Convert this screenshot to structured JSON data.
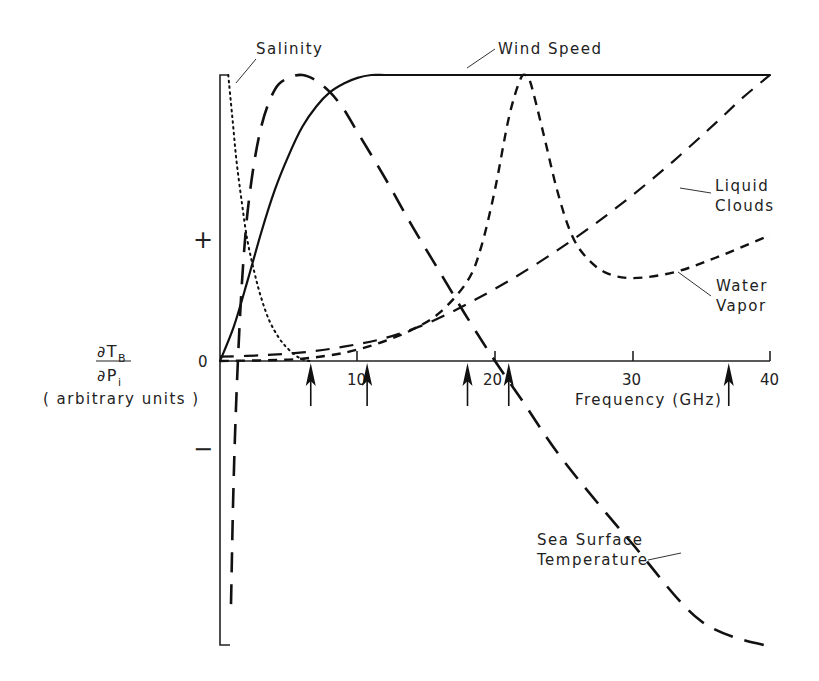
{
  "chart_data": {
    "type": "line",
    "title": "",
    "xlabel": "Frequency (GHz)",
    "ylabel_numerator": "∂T",
    "ylabel_numerator_sub": "B",
    "ylabel_denominator": "∂P",
    "ylabel_denominator_sub": "i",
    "ylabel_units": "( arbitrary units )",
    "xlim": [
      0,
      40
    ],
    "ylim": [
      -1.0,
      1.0
    ],
    "x_ticks": [
      10,
      20,
      30,
      40
    ],
    "x_tick_labels": [
      "10",
      "20",
      "30",
      "40"
    ],
    "y_tick_labels": {
      "plus": "+",
      "zero": "0",
      "minus": "−"
    },
    "grid": false,
    "legend": "inline annotations",
    "marked_frequencies_ghz": [
      6.6,
      10.7,
      18.0,
      21.0,
      37.0
    ],
    "series": [
      {
        "name": "Salinity",
        "style": "dotted",
        "x": [
          0.6,
          0.9,
          1.2,
          1.6,
          2.0,
          2.5,
          3.0,
          3.6,
          4.3,
          5.0,
          5.8,
          6.5
        ],
        "y": [
          1.0,
          0.85,
          0.7,
          0.55,
          0.42,
          0.31,
          0.22,
          0.14,
          0.08,
          0.04,
          0.01,
          0.0
        ]
      },
      {
        "name": "Wind Speed",
        "style": "solid",
        "x": [
          0,
          1,
          2,
          3,
          4,
          5,
          6,
          7,
          8,
          9,
          10,
          11,
          12,
          13,
          15,
          20,
          25,
          30,
          35,
          40
        ],
        "y": [
          0.0,
          0.12,
          0.28,
          0.45,
          0.6,
          0.72,
          0.82,
          0.89,
          0.94,
          0.97,
          0.99,
          1.0,
          1.0,
          1.0,
          1.0,
          1.0,
          1.0,
          1.0,
          1.0,
          1.0
        ]
      },
      {
        "name": "Sea Surface Temperature",
        "style": "long-dash",
        "x": [
          0.8,
          1.0,
          1.3,
          1.7,
          2.2,
          3.0,
          4.0,
          5.0,
          6.0,
          7.0,
          8.0,
          9.0,
          10.0,
          12.0,
          14.0,
          16.0,
          18.0,
          20.0,
          22.0,
          25.0,
          30.0,
          35.0,
          40.0
        ],
        "y": [
          -0.85,
          -0.4,
          0.0,
          0.35,
          0.6,
          0.82,
          0.95,
          0.99,
          1.0,
          0.98,
          0.94,
          0.88,
          0.8,
          0.64,
          0.47,
          0.31,
          0.15,
          0.0,
          -0.14,
          -0.35,
          -0.64,
          -0.91,
          -1.0
        ]
      },
      {
        "name": "Water Vapor",
        "style": "short-dash",
        "x": [
          0,
          5,
          8,
          10,
          12,
          14,
          16,
          18,
          19,
          20,
          21,
          21.8,
          22.2,
          22.6,
          23.5,
          24.5,
          25.5,
          26.5,
          28,
          30,
          33,
          36,
          40
        ],
        "y": [
          0.0,
          0.005,
          0.02,
          0.04,
          0.07,
          0.11,
          0.17,
          0.28,
          0.4,
          0.6,
          0.85,
          0.98,
          1.0,
          0.97,
          0.8,
          0.6,
          0.45,
          0.37,
          0.31,
          0.29,
          0.31,
          0.36,
          0.44
        ]
      },
      {
        "name": "Liquid Clouds",
        "style": "medium-dash",
        "x": [
          0,
          3,
          6,
          9,
          12,
          15,
          18,
          21,
          24,
          27,
          30,
          33,
          36,
          38,
          40
        ],
        "y": [
          0.015,
          0.02,
          0.03,
          0.05,
          0.08,
          0.13,
          0.2,
          0.28,
          0.37,
          0.47,
          0.58,
          0.7,
          0.83,
          0.92,
          1.0
        ]
      }
    ],
    "annotations": [
      {
        "text": "Salinity",
        "target_series": "Salinity"
      },
      {
        "text": "Wind Speed",
        "target_series": "Wind Speed"
      },
      {
        "text": "Liquid",
        "text2": "Clouds",
        "target_series": "Liquid Clouds"
      },
      {
        "text": "Water",
        "text2": "Vapor",
        "target_series": "Water Vapor"
      },
      {
        "text": "Sea Surface",
        "text2": "Temperature",
        "target_series": "Sea Surface Temperature"
      }
    ]
  }
}
